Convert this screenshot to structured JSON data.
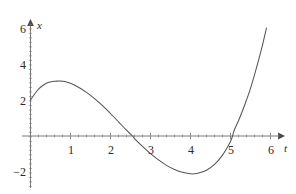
{
  "chart_data": {
    "type": "line",
    "title": "",
    "subtitle": "",
    "xlabel": "t",
    "ylabel": "x",
    "xlim": [
      -0.2,
      6.3
    ],
    "ylim": [
      -2.9,
      6.5
    ],
    "grid": false,
    "legend": null,
    "axis_style": "arrow-tipped cartesian axes crossing at origin",
    "x_ticks": [
      1,
      2,
      3,
      4,
      5,
      6
    ],
    "x_tick_labels": [
      "1",
      "2",
      "3",
      "4",
      "5",
      "6"
    ],
    "y_ticks": [
      -2,
      2,
      4,
      6
    ],
    "y_tick_labels": [
      "−2",
      "2",
      "4",
      "6"
    ],
    "minor_ticks": true,
    "series": [
      {
        "name": "x(t)",
        "color": "#555555",
        "points": [
          [
            0.0,
            2.0
          ],
          [
            0.1,
            2.32
          ],
          [
            0.2,
            2.6
          ],
          [
            0.3,
            2.79
          ],
          [
            0.4,
            2.93
          ],
          [
            0.5,
            3.0
          ],
          [
            0.6,
            3.04
          ],
          [
            0.7,
            3.05
          ],
          [
            0.75,
            3.05
          ],
          [
            0.8,
            3.04
          ],
          [
            0.9,
            3.0
          ],
          [
            1.0,
            2.93
          ],
          [
            1.2,
            2.71
          ],
          [
            1.4,
            2.42
          ],
          [
            1.6,
            2.08
          ],
          [
            1.8,
            1.69
          ],
          [
            2.0,
            1.25
          ],
          [
            2.2,
            0.79
          ],
          [
            2.4,
            0.32
          ],
          [
            2.55,
            0.0
          ],
          [
            2.6,
            -0.14
          ],
          [
            2.8,
            -0.58
          ],
          [
            3.0,
            -0.98
          ],
          [
            3.2,
            -1.33
          ],
          [
            3.4,
            -1.63
          ],
          [
            3.6,
            -1.86
          ],
          [
            3.8,
            -2.02
          ],
          [
            4.0,
            -2.1
          ],
          [
            4.1,
            -2.1
          ],
          [
            4.2,
            -2.06
          ],
          [
            4.4,
            -1.9
          ],
          [
            4.6,
            -1.58
          ],
          [
            4.8,
            -1.06
          ],
          [
            5.0,
            -0.3
          ],
          [
            5.05,
            0.0
          ],
          [
            5.1,
            0.36
          ],
          [
            5.2,
            0.85
          ],
          [
            5.3,
            1.4
          ],
          [
            5.4,
            2.0
          ],
          [
            5.5,
            2.65
          ],
          [
            5.6,
            3.4
          ],
          [
            5.7,
            4.2
          ],
          [
            5.8,
            5.05
          ],
          [
            5.9,
            6.0
          ]
        ]
      }
    ],
    "annotations": {
      "y_intercept": 2.0,
      "local_max": [
        0.75,
        3.05
      ],
      "local_min": [
        4.0,
        -2.1
      ],
      "roots": [
        2.55,
        5.05
      ]
    }
  },
  "axis_markers": {
    "x_axis_name": "t",
    "y_axis_name": "x"
  }
}
